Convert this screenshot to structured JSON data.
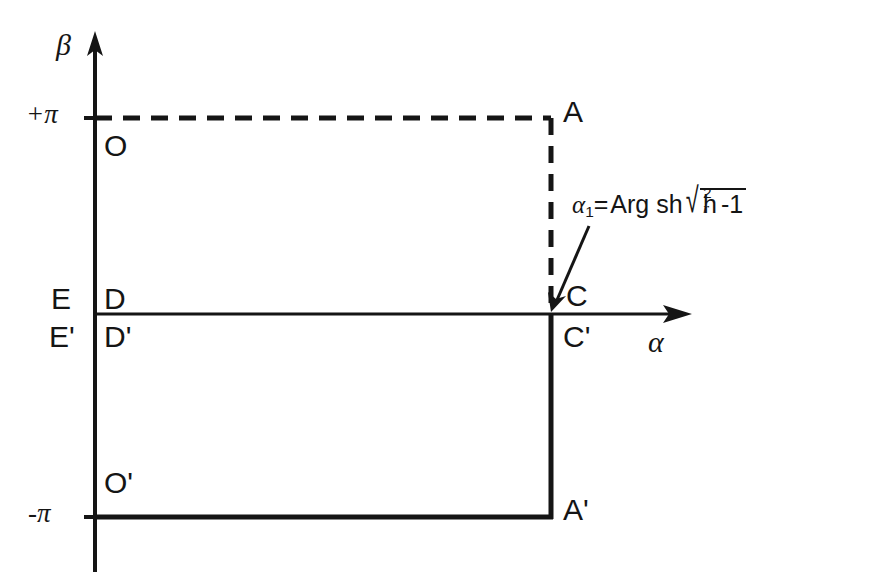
{
  "figure": {
    "background": "#ffffff",
    "ink_color": "#151515"
  },
  "axes": {
    "vertical": {
      "name": "beta-axis",
      "label": "β",
      "x": 95,
      "top": 35,
      "bottom": 572,
      "arrow": "up"
    },
    "horizontal": {
      "name": "alpha-axis",
      "label": "α",
      "y": 314,
      "left": 95,
      "right": 690,
      "arrow": "right"
    },
    "ticks": [
      {
        "label": "+π",
        "value": 3.14159,
        "y": 118
      },
      {
        "label": "-π",
        "value": -3.14159,
        "y": 517
      }
    ]
  },
  "rectangles": [
    {
      "name": "upper-rectangle",
      "style": "dashed",
      "corners": [
        "O",
        "A",
        "C",
        "D"
      ],
      "x_left": 95,
      "x_right": 551,
      "y_top": 118,
      "y_bottom": 314
    },
    {
      "name": "lower-rectangle",
      "style": "solid",
      "corners": [
        "D'",
        "C'",
        "A'",
        "O'"
      ],
      "x_left": 95,
      "x_right": 551,
      "y_top": 314,
      "y_bottom": 517
    }
  ],
  "point_labels": [
    {
      "id": "O",
      "text": "O",
      "x": 104,
      "y": 131,
      "region": "upper-left-inside"
    },
    {
      "id": "A",
      "text": "A",
      "x": 563,
      "y": 97,
      "region": "upper-right-outside"
    },
    {
      "id": "E",
      "text": "E",
      "x": 51,
      "y": 284,
      "region": "axis-left-above"
    },
    {
      "id": "D",
      "text": "D",
      "x": 104,
      "y": 284,
      "region": "axis-inside-above"
    },
    {
      "id": "Ep",
      "text": "E'",
      "x": 51,
      "y": 324,
      "region": "axis-left-below"
    },
    {
      "id": "Dp",
      "text": "D'",
      "x": 104,
      "y": 324,
      "region": "axis-inside-below"
    },
    {
      "id": "C",
      "text": "C",
      "x": 563,
      "y": 284,
      "region": "axis-right-above"
    },
    {
      "id": "Cp",
      "text": "C'",
      "x": 563,
      "y": 324,
      "region": "axis-right-below"
    },
    {
      "id": "Op",
      "text": "O'",
      "x": 104,
      "y": 470,
      "region": "lower-left-inside"
    },
    {
      "id": "Ap",
      "text": "A'",
      "x": 563,
      "y": 497,
      "region": "lower-right-outside"
    }
  ],
  "annotation": {
    "name": "alpha1-formula",
    "parts": {
      "variable": "α",
      "subscript": "1",
      "equals": "=",
      "function": "Arg sh",
      "radicand_base": "h",
      "radicand_sup": "2",
      "radicand_sub": "r",
      "radicand_tail": "-1"
    },
    "plain_text": "α₁=Arg sh √(hᵣ²-1)",
    "x": 572,
    "y": 190,
    "leader": {
      "name": "leader-arrow",
      "from_x": 588,
      "from_y": 228,
      "to_x": 553,
      "to_y": 308
    }
  }
}
